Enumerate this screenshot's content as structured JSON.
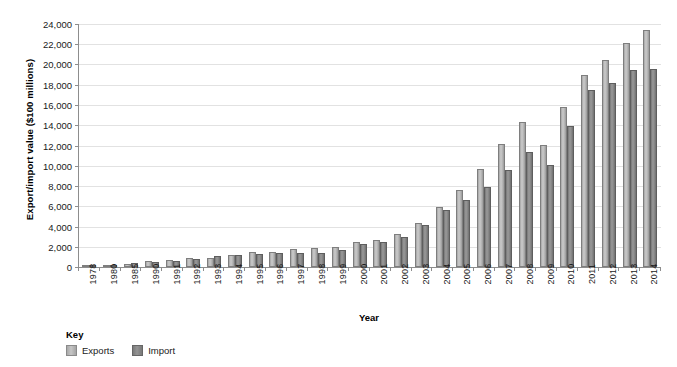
{
  "top_sliver_text": "cut-off text row",
  "chart_data": {
    "type": "bar",
    "title": "",
    "xlabel": "Year",
    "ylabel": "Export/import value ($100 millions)",
    "ylim": [
      0,
      24000
    ],
    "ytick_step": 2000,
    "ytick_labels": [
      "0",
      "2,000",
      "4,000",
      "6,000",
      "8,000",
      "10,000",
      "12,000",
      "14,000",
      "16,000",
      "18,000",
      "20,000",
      "22,000",
      "24,000"
    ],
    "grid": true,
    "legend_position": "below-left",
    "legend_title": "Key",
    "categories": [
      "1978",
      "1980",
      "1985",
      "1990",
      "1991",
      "1992",
      "1993",
      "1994",
      "1995",
      "1996",
      "1997",
      "1998",
      "1999",
      "2000",
      "2001",
      "2002",
      "2003",
      "2004",
      "2005",
      "2006",
      "2007",
      "2008",
      "2009",
      "2010",
      "2011",
      "2012",
      "2013",
      "2014"
    ],
    "series": [
      {
        "name": "Exports",
        "color": "#bdbdbd",
        "values": [
          98,
          181,
          274,
          621,
          719,
          850,
          917,
          1210,
          1488,
          1511,
          1828,
          1838,
          1949,
          2492,
          2661,
          3256,
          4382,
          5934,
          7620,
          9690,
          12180,
          14307,
          12016,
          15779,
          18984,
          20489,
          22090,
          23423
        ]
      },
      {
        "name": "Import",
        "color": "#8d8d8d",
        "values": [
          109,
          200,
          423,
          534,
          638,
          806,
          1040,
          1156,
          1321,
          1388,
          1424,
          1402,
          1657,
          2251,
          2436,
          2952,
          4128,
          5612,
          6600,
          7915,
          9560,
          11326,
          10059,
          13962,
          17435,
          18178,
          19500,
          19592
        ]
      }
    ]
  }
}
